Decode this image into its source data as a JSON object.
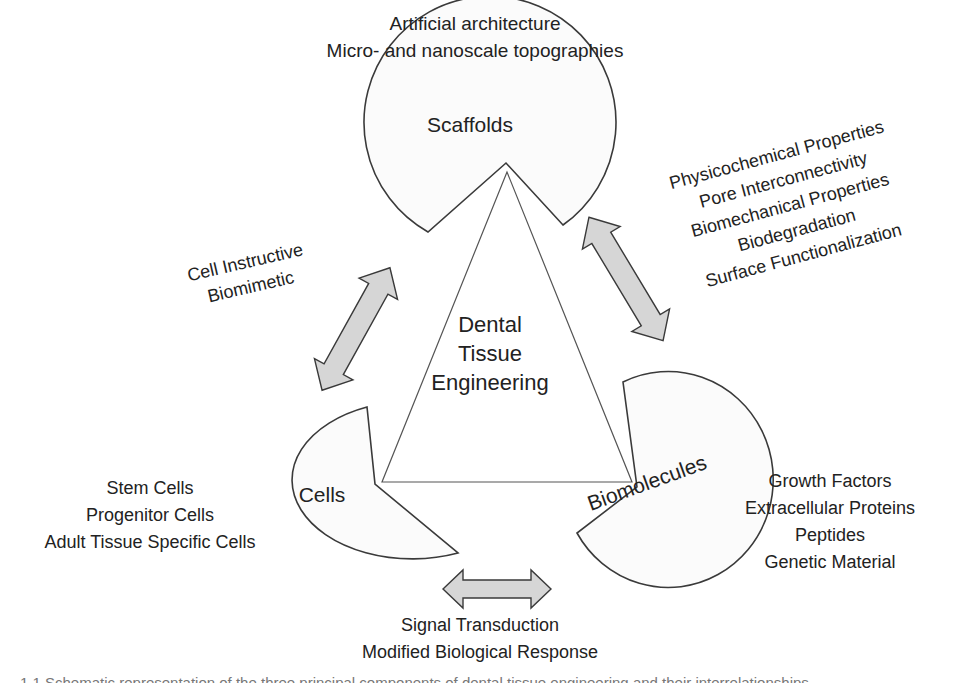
{
  "diagram": {
    "title": "Dental Tissue Engineering",
    "center": {
      "lines": [
        "Dental",
        "Tissue",
        "Engineering"
      ]
    },
    "components": {
      "scaffolds": {
        "name": "Scaffolds",
        "attributes": [
          "Artificial architecture",
          "Micro- and nanoscale topographies"
        ]
      },
      "cells": {
        "name": "Cells",
        "attributes": [
          "Stem Cells",
          "Progenitor Cells",
          "Adult Tissue Specific Cells"
        ]
      },
      "biomolecules": {
        "name": "Biomolecules",
        "attributes": [
          "Growth Factors",
          "Extracellular Proteins",
          "Peptides",
          "Genetic Material"
        ]
      }
    },
    "interactions": {
      "cells_scaffolds": {
        "arrow": "double-arrow-icon",
        "labels": [
          "Cell Instructive",
          "Biomimetic"
        ]
      },
      "scaffolds_biomolecules": {
        "arrow": "double-arrow-icon",
        "labels": [
          "Physicochemical Properties",
          "Pore Interconnectivity",
          "Biomechanical Properties",
          "Biodegradation",
          "Surface Functionalization"
        ]
      },
      "cells_biomolecules": {
        "arrow": "double-arrow-icon",
        "labels": [
          "Signal Transduction",
          "Modified Biological Response"
        ]
      }
    },
    "colors": {
      "shape_fill": "#fbfbfb",
      "outline": "#3a3a3a",
      "arrow_fill": "#d6d6d6",
      "text": "#222222"
    }
  },
  "caption": {
    "text": "1.1  Schematic representation of the three principal components of dental tissue engineering and their interrelationships"
  }
}
